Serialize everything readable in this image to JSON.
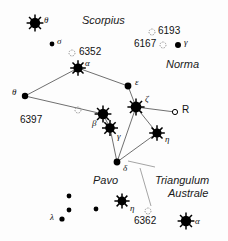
{
  "chart_data": {
    "type": "scatter",
    "xlabel": "",
    "ylabel": "",
    "xlim": [
      0,
      228
    ],
    "ylim": [
      0,
      241
    ],
    "grid": false,
    "legend": "none",
    "constellation_labels": [
      {
        "name": "Scorpius",
        "x": 82,
        "y": 14
      },
      {
        "name": "Norma",
        "x": 166,
        "y": 58
      },
      {
        "name": "Pavo",
        "x": 93,
        "y": 174
      },
      {
        "name": "Triangulum",
        "x": 155,
        "y": 174
      },
      {
        "name": "Australe",
        "x": 168,
        "y": 187
      }
    ],
    "stars": [
      {
        "label": "θ",
        "x": 35,
        "y": 23,
        "r": 5.2,
        "kind": "spiked",
        "lx": 44,
        "ly": 15
      },
      {
        "label": "σ",
        "x": 52,
        "y": 44,
        "r": 2.4,
        "kind": "dot",
        "lx": 57,
        "ly": 36
      },
      {
        "label": "α",
        "x": 78,
        "y": 68,
        "r": 4.6,
        "kind": "spiked",
        "lx": 85,
        "ly": 58
      },
      {
        "label": "θ",
        "x": 25,
        "y": 96,
        "r": 3.2,
        "kind": "dot",
        "lx": 12,
        "ly": 87
      },
      {
        "label": "ε",
        "x": 128,
        "y": 86,
        "r": 3.4,
        "kind": "dot",
        "lx": 135,
        "ly": 77
      },
      {
        "label": "ζ",
        "x": 136,
        "y": 107,
        "r": 5.4,
        "kind": "spiked",
        "lx": 145,
        "ly": 94
      },
      {
        "label": "R",
        "x": 175,
        "y": 112,
        "r": 2.6,
        "kind": "open",
        "lx": 182,
        "ly": 104
      },
      {
        "label": "β",
        "x": 103,
        "y": 114,
        "r": 5.2,
        "kind": "spiked",
        "lx": 92,
        "ly": 118
      },
      {
        "label": "γ",
        "x": 110,
        "y": 128,
        "r": 4.8,
        "kind": "spiked",
        "lx": 117,
        "ly": 131
      },
      {
        "label": "η",
        "x": 157,
        "y": 133,
        "r": 4.6,
        "kind": "spiked",
        "lx": 165,
        "ly": 134
      },
      {
        "label": "δ",
        "x": 117,
        "y": 162,
        "r": 3.4,
        "kind": "dot",
        "lx": 123,
        "ly": 163
      },
      {
        "label": "γ",
        "x": 178,
        "y": 45,
        "r": 3.0,
        "kind": "dot",
        "lx": 184,
        "ly": 37
      },
      {
        "label": "η",
        "x": 122,
        "y": 201,
        "r": 4.4,
        "kind": "spiked",
        "lx": 130,
        "ly": 203
      },
      {
        "label": "α",
        "x": 186,
        "y": 221,
        "r": 5.2,
        "kind": "spiked",
        "lx": 195,
        "ly": 216
      },
      {
        "label": "λ",
        "x": 62,
        "y": 219,
        "r": 2.6,
        "kind": "dot",
        "lx": 50,
        "ly": 212
      },
      {
        "label": "",
        "x": 69,
        "y": 196,
        "r": 2.4,
        "kind": "dot",
        "lx": 0,
        "ly": 0
      },
      {
        "label": "",
        "x": 69,
        "y": 210,
        "r": 2.4,
        "kind": "dot",
        "lx": 0,
        "ly": 0
      },
      {
        "label": "",
        "x": 96,
        "y": 209,
        "r": 2.4,
        "kind": "dot",
        "lx": 0,
        "ly": 0
      }
    ],
    "clusters": [
      {
        "label": "6352",
        "x": 72,
        "y": 53,
        "lx": 79,
        "ly": 46
      },
      {
        "label": "6397",
        "x": 78,
        "y": 110,
        "lx": 20,
        "ly": 114
      },
      {
        "label": "6193",
        "x": 152,
        "y": 32,
        "lx": 158,
        "ly": 25
      },
      {
        "label": "6167",
        "x": 163,
        "y": 45,
        "lx": 134,
        "ly": 38
      },
      {
        "label": "6362",
        "x": 148,
        "y": 211,
        "lx": 134,
        "ly": 215
      }
    ],
    "constellation_lines": [
      [
        78,
        68,
        25,
        96
      ],
      [
        78,
        68,
        128,
        86
      ],
      [
        128,
        86,
        136,
        107
      ],
      [
        25,
        96,
        103,
        114
      ],
      [
        103,
        114,
        110,
        128
      ],
      [
        136,
        107,
        175,
        112
      ],
      [
        136,
        107,
        157,
        133
      ],
      [
        110,
        128,
        117,
        162
      ],
      [
        117,
        162,
        157,
        133
      ],
      [
        136,
        107,
        117,
        162
      ]
    ],
    "boundary_lines": [
      [
        128,
        161,
        155,
        167
      ],
      [
        140,
        168,
        151,
        206
      ]
    ]
  }
}
